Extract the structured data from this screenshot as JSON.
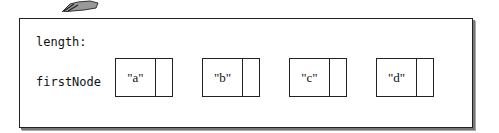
{
  "figure": {
    "fields": [
      {
        "label": "length:"
      },
      {
        "label": "firstNode"
      }
    ],
    "nodes": [
      {
        "data": "\"a\""
      },
      {
        "data": "\"b\""
      },
      {
        "data": "\"c\""
      },
      {
        "data": "\"d\""
      }
    ],
    "colors": {
      "stroke": "#222222",
      "background": "#ffffff",
      "shadow": "#777777"
    }
  }
}
